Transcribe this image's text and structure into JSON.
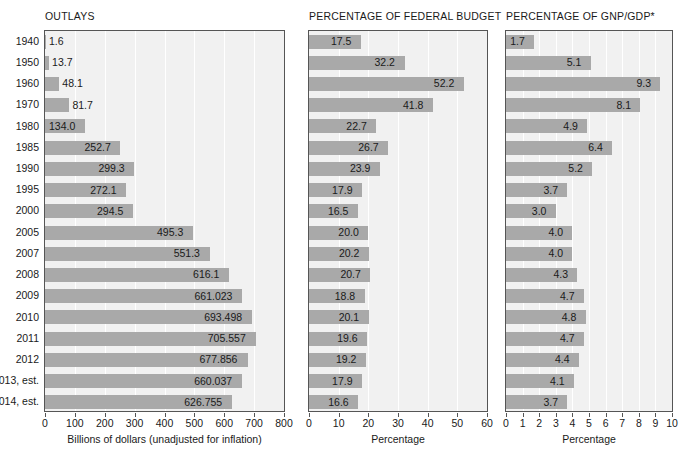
{
  "chart_data": {
    "type": "bar",
    "title": "",
    "categories": [
      "1940",
      "1950",
      "1960",
      "1970",
      "1980",
      "1985",
      "1990",
      "1995",
      "2000",
      "2005",
      "2007",
      "2008",
      "2009",
      "2010",
      "2011",
      "2012",
      "2013, est.",
      "2014, est."
    ],
    "panels": [
      {
        "title": "OUTLAYS",
        "xlabel": "Billions of dollars (unadjusted for inflation)",
        "ylabel": "",
        "xlim": [
          0,
          800
        ],
        "xticks": [
          0,
          100,
          200,
          300,
          400,
          500,
          600,
          700,
          800
        ],
        "xtick_labels": [
          "0",
          "100",
          "200",
          "300",
          "400",
          "500",
          "600",
          "700",
          "800"
        ],
        "values": [
          1.6,
          13.7,
          48.1,
          81.7,
          134.0,
          252.7,
          299.3,
          272.1,
          294.5,
          495.3,
          551.3,
          616.1,
          661.023,
          693.498,
          705.557,
          677.856,
          660.037,
          626.755
        ],
        "value_labels": [
          "1.6",
          "13.7",
          "48.1",
          "81.7",
          "134.0",
          "252.7",
          "299.3",
          "272.1",
          "294.5",
          "495.3",
          "551.3",
          "616.1",
          "661.023",
          "693.498",
          "705.557",
          "677.856",
          "660.037",
          "626.755"
        ]
      },
      {
        "title": "PERCENTAGE OF FEDERAL BUDGET",
        "xlabel": "Percentage",
        "ylabel": "",
        "xlim": [
          0,
          60
        ],
        "xticks": [
          0,
          10,
          20,
          30,
          40,
          50,
          60
        ],
        "xtick_labels": [
          "0",
          "10",
          "20",
          "30",
          "40",
          "50",
          "60"
        ],
        "values": [
          17.5,
          32.2,
          52.2,
          41.8,
          22.7,
          26.7,
          23.9,
          17.9,
          16.5,
          20.0,
          20.2,
          20.7,
          18.8,
          20.1,
          19.6,
          19.2,
          17.9,
          16.6
        ],
        "value_labels": [
          "17.5",
          "32.2",
          "52.2",
          "41.8",
          "22.7",
          "26.7",
          "23.9",
          "17.9",
          "16.5",
          "20.0",
          "20.2",
          "20.7",
          "18.8",
          "20.1",
          "19.6",
          "19.2",
          "17.9",
          "16.6"
        ]
      },
      {
        "title": "PERCENTAGE OF GNP/GDP*",
        "xlabel": "Percentage",
        "ylabel": "",
        "xlim": [
          0,
          10
        ],
        "xticks": [
          0,
          1,
          2,
          3,
          4,
          5,
          6,
          7,
          8,
          9,
          10
        ],
        "xtick_labels": [
          "0",
          "1",
          "2",
          "3",
          "4",
          "5",
          "6",
          "7",
          "8",
          "9",
          "10"
        ],
        "values": [
          1.7,
          5.1,
          9.3,
          8.1,
          4.9,
          6.4,
          5.2,
          3.7,
          3.0,
          4.0,
          4.0,
          4.3,
          4.7,
          4.8,
          4.7,
          4.4,
          4.1,
          3.7
        ],
        "value_labels": [
          "1.7",
          "5.1",
          "9.3",
          "8.1",
          "4.9",
          "6.4",
          "5.2",
          "3.7",
          "3.0",
          "4.0",
          "4.0",
          "4.3",
          "4.7",
          "4.8",
          "4.7",
          "4.4",
          "4.1",
          "3.7"
        ]
      }
    ],
    "grid": "vertical",
    "legend": "none",
    "bar_color": "#a9a9a9",
    "plot_background": "#f1f1f1",
    "gridline_color": "#ffffff",
    "axis_color": "#555555"
  },
  "layout": {
    "panel_left": [
      44,
      308,
      505
    ],
    "panel_width": [
      241,
      180,
      168
    ],
    "plot_top": 30,
    "row_height": 20,
    "plot_height": 382
  }
}
